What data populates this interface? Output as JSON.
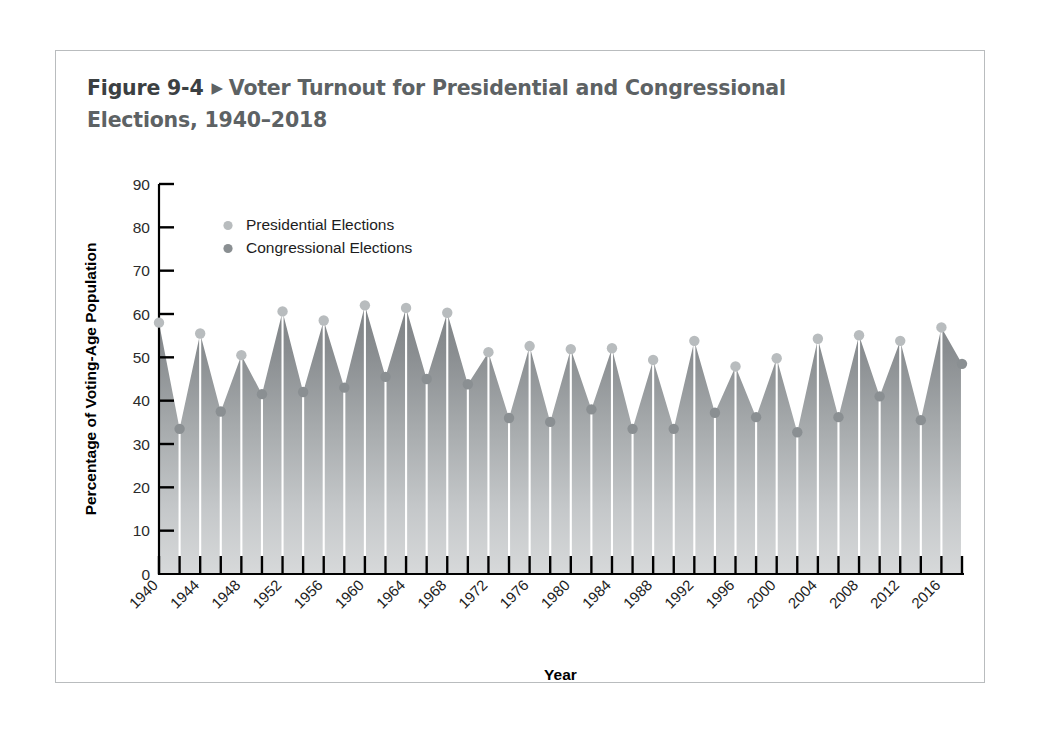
{
  "figure": {
    "number": "Figure 9-4",
    "arrow_icon": "triangle-right-icon",
    "title": "Voter Turnout for Presidential and Congressional Elections, 1940–2018"
  },
  "colors": {
    "frame_border": "#b9bcbe",
    "presidential_marker": "#b8bcbe",
    "congressional_marker": "#8a8f92",
    "area_top": "#85898c",
    "area_bottom": "#d3d5d6",
    "axis": "#000000",
    "title_text": "#5d6264"
  },
  "chart_data": {
    "type": "area",
    "title": "Voter Turnout for Presidential and Congressional Elections, 1940–2018",
    "xlabel": "Year",
    "ylabel": "Percentage of Voting-Age Population",
    "ylim": [
      0,
      90
    ],
    "xlim": [
      1940,
      2018
    ],
    "ytick_step": 10,
    "yticks": [
      0,
      10,
      20,
      30,
      40,
      50,
      60,
      70,
      80,
      90
    ],
    "xtick_labels": [
      "1940",
      "1944",
      "1948",
      "1952",
      "1956",
      "1960",
      "1964",
      "1968",
      "1972",
      "1976",
      "1980",
      "1984",
      "1988",
      "1992",
      "1996",
      "2000",
      "2004",
      "2008",
      "2012",
      "2016"
    ],
    "xtick_label_step": 4,
    "xtick_minor_step": 2,
    "grid": false,
    "legend_position": "upper-left-inside",
    "legend": [
      {
        "label": "Presidential Elections",
        "marker": "light-gray-dot"
      },
      {
        "label": "Congressional Elections",
        "marker": "dark-gray-dot"
      }
    ],
    "x": [
      1940,
      1942,
      1944,
      1946,
      1948,
      1950,
      1952,
      1954,
      1956,
      1958,
      1960,
      1962,
      1964,
      1966,
      1968,
      1970,
      1972,
      1974,
      1976,
      1978,
      1980,
      1982,
      1984,
      1986,
      1988,
      1990,
      1992,
      1994,
      1996,
      1998,
      2000,
      2002,
      2004,
      2006,
      2008,
      2010,
      2012,
      2014,
      2016,
      2018
    ],
    "values": [
      58.0,
      33.5,
      55.5,
      37.5,
      50.5,
      41.5,
      60.6,
      42.0,
      58.5,
      43.0,
      62.0,
      45.5,
      61.4,
      45.0,
      60.3,
      43.8,
      51.2,
      36.0,
      52.6,
      35.1,
      51.9,
      38.0,
      52.1,
      33.5,
      49.4,
      33.5,
      53.8,
      37.2,
      47.9,
      36.2,
      49.8,
      32.7,
      54.3,
      36.2,
      55.1,
      41.0,
      53.8,
      35.5,
      56.9,
      48.5
    ],
    "series": [
      {
        "name": "Presidential Elections",
        "x": [
          1940,
          1944,
          1948,
          1952,
          1956,
          1960,
          1964,
          1968,
          1972,
          1976,
          1980,
          1984,
          1988,
          1992,
          1996,
          2000,
          2004,
          2008,
          2012,
          2016
        ],
        "values": [
          58.0,
          55.5,
          50.5,
          60.6,
          58.5,
          62.0,
          61.4,
          60.3,
          51.2,
          52.6,
          51.9,
          52.1,
          49.4,
          53.8,
          47.9,
          49.8,
          54.3,
          55.1,
          53.8,
          56.9
        ]
      },
      {
        "name": "Congressional Elections",
        "x": [
          1942,
          1946,
          1950,
          1954,
          1958,
          1962,
          1966,
          1970,
          1974,
          1978,
          1982,
          1986,
          1990,
          1994,
          1998,
          2002,
          2006,
          2010,
          2014,
          2018
        ],
        "values": [
          33.5,
          37.5,
          41.5,
          42.0,
          43.0,
          45.5,
          45.0,
          43.8,
          36.0,
          35.1,
          38.0,
          33.5,
          33.5,
          37.2,
          36.2,
          32.7,
          36.2,
          41.0,
          35.5,
          48.5
        ]
      }
    ]
  }
}
